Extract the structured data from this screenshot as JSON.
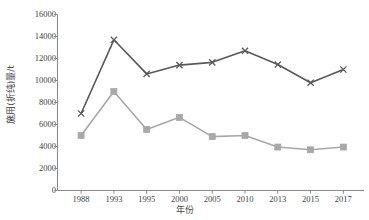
{
  "chart_data": {
    "type": "line",
    "title": "",
    "xlabel": "年份",
    "ylabel": "施用(折纯)量/t",
    "categories": [
      "1988",
      "1993",
      "1995",
      "2000",
      "2005",
      "2010",
      "2013",
      "2015",
      "2017"
    ],
    "ylim": [
      0,
      16000
    ],
    "yticks": [
      "0",
      "2000",
      "4000",
      "6000",
      "8000",
      "10000",
      "12000",
      "14000",
      "16000"
    ],
    "ytick_values": [
      0,
      2000,
      4000,
      6000,
      8000,
      10000,
      12000,
      14000,
      16000
    ],
    "grid": false,
    "legend_position": "top-right",
    "series": [
      {
        "name": "series-dark",
        "marker": "x",
        "color": "#595959",
        "values": [
          7000,
          13700,
          10600,
          11400,
          11650,
          12700,
          11450,
          9800,
          11000
        ]
      },
      {
        "name": "series-light",
        "marker": "square",
        "color": "#a8a8a8",
        "values": [
          5000,
          9000,
          5550,
          6650,
          4900,
          5000,
          3950,
          3700,
          3950
        ]
      }
    ]
  },
  "axis": {
    "line_color": "#8a8a8a",
    "tick_color": "#8a8a8a"
  },
  "clipped_header": {
    "title_fragment": "",
    "legend_fragment": ""
  }
}
